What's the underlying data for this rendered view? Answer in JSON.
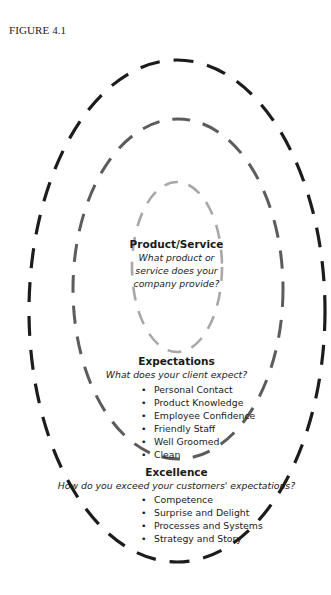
{
  "figure_label": "FIGURE 4.1",
  "colors": {
    "outer_ring": "#1c1c1c",
    "middle_ring": "#5c5c5c",
    "inner_ring": "#a8a8a8",
    "text": "#1a1a1a",
    "background": "#ffffff"
  },
  "rings": {
    "inner": {
      "title": "Product/Service",
      "question_lines": [
        "What product or",
        "service does your",
        "company provide?"
      ]
    },
    "middle": {
      "title": "Expectations",
      "question": "What does your client expect?",
      "items": [
        "Personal Contact",
        "Product Knowledge",
        "Employee Confidence",
        "Friendly Staff",
        "Well Groomed",
        "Clean"
      ]
    },
    "outer": {
      "title": "Excellence",
      "question": "How do you exceed your customers' expectations?",
      "items": [
        "Competence",
        "Surprise and Delight",
        "Processes and Systems",
        "Strategy and Story"
      ]
    }
  }
}
